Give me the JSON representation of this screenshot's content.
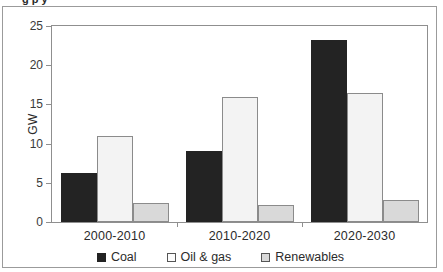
{
  "figure": {
    "clipped_title_fragment": "g                                                 p      y"
  },
  "chart_data": {
    "type": "bar",
    "title": "",
    "xlabel": "",
    "ylabel": "GW",
    "categories": [
      "2000-2010",
      "2010-2020",
      "2020-2030"
    ],
    "series": [
      {
        "name": "Coal",
        "color": "#232323",
        "values": [
          6.2,
          9.0,
          23.2
        ]
      },
      {
        "name": "Oil & gas",
        "color": "#f3f3f3",
        "values": [
          11.0,
          15.9,
          16.5
        ]
      },
      {
        "name": "Renewables",
        "color": "#d9d9d9",
        "values": [
          2.4,
          2.2,
          2.8
        ]
      }
    ],
    "ylim": [
      0,
      25
    ],
    "yticks": [
      0,
      5,
      10,
      15,
      20,
      25
    ],
    "ytick_labels": [
      "0",
      "5",
      "10",
      "15",
      "20",
      "25"
    ],
    "grid": false,
    "legend_position": "bottom",
    "legend_entries": [
      "Coal",
      "Oil & gas",
      "Renewables"
    ]
  },
  "axis": {
    "y_title": "GW"
  },
  "legend": {
    "items": [
      {
        "label": "Coal"
      },
      {
        "label": "Oil & gas"
      },
      {
        "label": "Renewables"
      }
    ]
  }
}
